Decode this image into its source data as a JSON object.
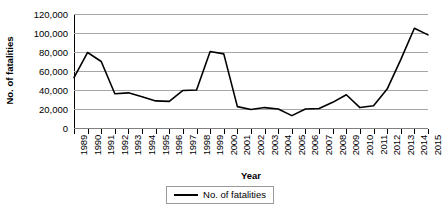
{
  "chart_data": {
    "type": "line",
    "title": "",
    "xlabel": "Year",
    "ylabel": "No. of fatalities",
    "categories": [
      "1989",
      "1990",
      "1991",
      "1992",
      "1993",
      "1994",
      "1995",
      "1996",
      "1997",
      "1998",
      "1999",
      "2000",
      "2001",
      "2002",
      "2003",
      "2004",
      "2005",
      "2006",
      "2007",
      "2008",
      "2009",
      "2010",
      "2011",
      "2012",
      "2013",
      "2014",
      "2015"
    ],
    "values": [
      53000,
      79500,
      70000,
      36000,
      37000,
      33000,
      28500,
      28000,
      39500,
      40000,
      80500,
      78000,
      22500,
      19500,
      21500,
      20000,
      13000,
      20000,
      20500,
      27000,
      35000,
      21500,
      23500,
      41000,
      72000,
      105000,
      98000
    ],
    "series": [
      {
        "name": "No. of fatalities",
        "values": [
          53000,
          79500,
          70000,
          36000,
          37000,
          33000,
          28500,
          28000,
          39500,
          40000,
          80500,
          78000,
          22500,
          19500,
          21500,
          20000,
          13000,
          20000,
          20500,
          27000,
          35000,
          21500,
          23500,
          41000,
          72000,
          105000,
          98000
        ],
        "color": "#000000"
      }
    ],
    "ylim": [
      0,
      120000
    ],
    "ytick_values": [
      0,
      20000,
      40000,
      60000,
      80000,
      100000,
      120000
    ],
    "ytick_labels": [
      "0",
      "20,000",
      "40,000",
      "60,000",
      "80,000",
      "100,000",
      "120,000"
    ],
    "grid": true,
    "grid_axis": "y",
    "legend_position": "bottom",
    "legend_entries": [
      "No. of fatalities"
    ]
  },
  "axes": {
    "y_title": "No. of fatalities",
    "x_title": "Year"
  },
  "legend": {
    "label": "No. of fatalities"
  },
  "colors": {
    "line": "#000000",
    "gridline": "#a6a6a6",
    "axis": "#000000",
    "background": "#ffffff"
  }
}
